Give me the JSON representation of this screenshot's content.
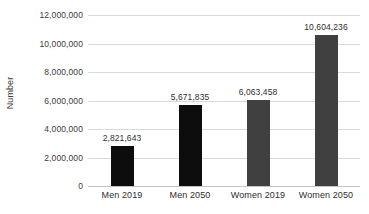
{
  "chart_data": {
    "type": "bar",
    "title": "",
    "xlabel": "",
    "ylabel": "Number",
    "categories": [
      "Men 2019",
      "Men 2050",
      "Women 2019",
      "Women 2050"
    ],
    "values": [
      2821643,
      5671835,
      6063458,
      10604236
    ],
    "value_labels": [
      "2,821,643",
      "5,671,835",
      "6,063,458",
      "10,604,236"
    ],
    "bar_colors": [
      "#0d0d0d",
      "#0d0d0d",
      "#404040",
      "#404040"
    ],
    "ylim": [
      0,
      12000000
    ],
    "ytick_values": [
      0,
      2000000,
      4000000,
      6000000,
      8000000,
      10000000,
      12000000
    ],
    "ytick_labels": [
      "0",
      "2,000,000",
      "4,000,000",
      "6,000,000",
      "8,000,000",
      "10,000,000",
      "12,000,000"
    ],
    "grid": true,
    "grid_color": "#d9d9d9",
    "legend": false,
    "legend_position": "none"
  }
}
